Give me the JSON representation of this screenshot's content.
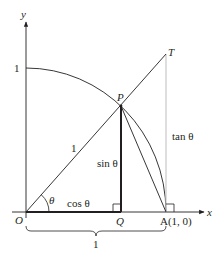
{
  "diagram": {
    "type": "unit-circle-trig-definitions",
    "colors": {
      "ink": "#231f20",
      "tangent_line": "#c8c8c8",
      "background": "#ffffff"
    },
    "axes": {
      "x_label": "x",
      "y_label": "y"
    },
    "labels": {
      "origin": "O",
      "point_p": "P",
      "point_t": "T",
      "point_q": "Q",
      "point_a": "A(1, 0)",
      "y_intercept": "1",
      "radius": "1",
      "angle": "θ",
      "cos": "cos θ",
      "sin": "sin θ",
      "tan": "tan θ",
      "brace_length": "1"
    }
  }
}
